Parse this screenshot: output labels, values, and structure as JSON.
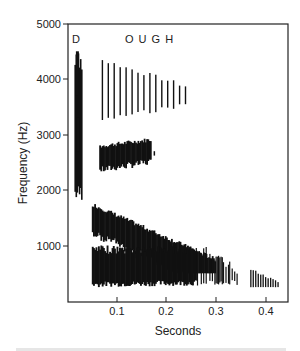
{
  "chart_data": {
    "type": "heatmap",
    "subtype": "spectrogram",
    "title": "",
    "xlabel": "Seconds",
    "ylabel": "Frequency (Hz)",
    "xlim": [
      0,
      0.44
    ],
    "ylim": [
      0,
      5000
    ],
    "x_ticks": [
      0.1,
      0.2,
      0.3,
      0.4
    ],
    "x_tick_labels": [
      "0.1",
      "0.2",
      "0.3",
      "0.4"
    ],
    "y_ticks": [
      1000,
      2000,
      3000,
      4000,
      5000
    ],
    "y_tick_labels": [
      "1000",
      "2000",
      "3000",
      "4000",
      "5000"
    ],
    "grid": false,
    "legend": null,
    "annotations": [
      {
        "text": "D",
        "x": 0.02,
        "y": 4780
      },
      {
        "text": "O U G H",
        "x": 0.13,
        "y": 4780
      }
    ],
    "series": [
      {
        "name": "D burst",
        "t_start": 0.015,
        "t_end": 0.03,
        "f_low": 1800,
        "f_high": 4500
      },
      {
        "name": "formant band 4 (OUGH)",
        "t_start": 0.07,
        "t_end": 0.25,
        "f_low": 3300,
        "f_high": 4300,
        "note": "striated, tapering"
      },
      {
        "name": "formant band 3 (OUGH)",
        "t_start": 0.065,
        "t_end": 0.17,
        "f_low": 2300,
        "f_high": 2900
      },
      {
        "name": "formant band 2 (OUGH)",
        "t_start": 0.05,
        "t_end": 0.3,
        "f_start_high": 1700,
        "f_end_high": 700,
        "note": "falling second formant"
      },
      {
        "name": "formant band 1 (OUGH)",
        "t_start": 0.05,
        "t_end": 0.35,
        "f_low": 250,
        "f_high": 1000
      },
      {
        "name": "trailing segment",
        "t_start": 0.37,
        "t_end": 0.43,
        "f_low": 250,
        "f_high": 550
      }
    ]
  },
  "labels": {
    "phoneme_d": "D",
    "phoneme_ough": "O U G H",
    "x_axis_title": "Seconds",
    "y_axis_title": "Frequency (Hz)",
    "y_ticks": [
      "5000",
      "4000",
      "3000",
      "2000",
      "1000"
    ],
    "x_ticks": [
      "0.1",
      "0.2",
      "0.3",
      "0.4"
    ]
  }
}
